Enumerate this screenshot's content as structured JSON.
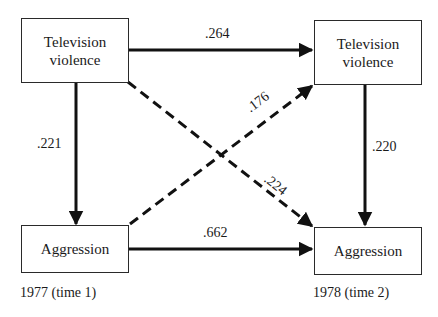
{
  "diagram": {
    "nodes": {
      "tv_1977": {
        "label_line1": "Television",
        "label_line2": "violence"
      },
      "tv_1978": {
        "label_line1": "Television",
        "label_line2": "violence"
      },
      "agg_1977": {
        "label": "Aggression"
      },
      "agg_1978": {
        "label": "Aggression"
      }
    },
    "edges": {
      "tv1977_to_tv1978": {
        "value": ".264",
        "style": "solid"
      },
      "tv1977_to_agg1977": {
        "value": ".221",
        "style": "solid"
      },
      "tv1978_to_agg1978": {
        "value": ".220",
        "style": "solid"
      },
      "agg1977_to_agg1978": {
        "value": ".662",
        "style": "solid"
      },
      "agg1977_to_tv1978": {
        "value": ".176",
        "style": "dashed"
      },
      "tv1977_to_agg1978": {
        "value": ".224",
        "style": "dashed"
      }
    },
    "captions": {
      "time1": "1977 (time 1)",
      "time2": "1978 (time 2)"
    }
  }
}
